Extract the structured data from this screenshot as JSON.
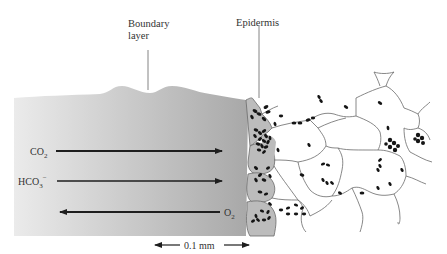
{
  "figure": {
    "labels": {
      "boundary_layer_line1": "Boundary",
      "boundary_layer_line2": "layer",
      "epidermis": "Epidermis"
    },
    "fluxes": [
      {
        "species": "CO",
        "subscript": "2",
        "superscript": "",
        "direction": "inward",
        "arrow_weight": "thick"
      },
      {
        "species": "HCO",
        "subscript": "3",
        "superscript": "−",
        "direction": "inward",
        "arrow_weight": "thin"
      },
      {
        "species": "O",
        "subscript": "2",
        "superscript": "",
        "direction": "outward",
        "arrow_weight": "thick"
      }
    ],
    "scale_bar": {
      "label": "0.1 mm"
    },
    "regions": [
      {
        "name": "boundary-layer",
        "fill": "#b9b9b9"
      },
      {
        "name": "epidermis",
        "fill": "#bdbdbd"
      },
      {
        "name": "mesophyll",
        "fill": "#ffffff"
      }
    ],
    "colors": {
      "boundary_layer_light": "#e9e9e9",
      "boundary_layer_dark": "#a9a9a9",
      "arrow": "#1e1e1e",
      "chloroplast": "#151515",
      "cell_wall": "#6a6a6a",
      "text": "#333333"
    }
  }
}
